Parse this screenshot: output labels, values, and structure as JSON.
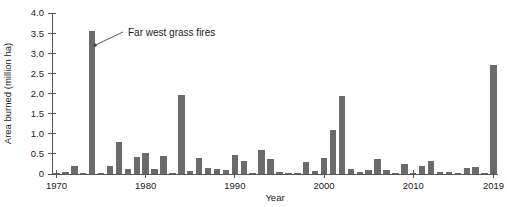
{
  "chart_data": {
    "type": "bar",
    "title": "",
    "subtitle": "",
    "xlabel": "Year",
    "ylabel": "Area burned (million ha)",
    "xlim": [
      1969.5,
      2019.5
    ],
    "ylim": [
      0,
      4.0
    ],
    "grid": false,
    "legend": false,
    "legend_position": "none",
    "bar_color": "#6b6b6b",
    "axis_color": "#555555",
    "y_ticks": [
      0,
      0.5,
      1.0,
      1.5,
      2.0,
      2.5,
      3.0,
      3.5,
      4.0
    ],
    "y_tick_labels": [
      "0",
      "0.5",
      "1.0",
      "1.5",
      "2.0",
      "2.5",
      "3.0",
      "3.5",
      "4.0"
    ],
    "x_ticks": [
      1970,
      1980,
      1990,
      2000,
      2010,
      2019
    ],
    "x_tick_labels": [
      "1970",
      "1980",
      "1990",
      "2000",
      "2010",
      "2019"
    ],
    "categories": [
      1970,
      1971,
      1972,
      1973,
      1974,
      1975,
      1976,
      1977,
      1978,
      1979,
      1980,
      1981,
      1982,
      1983,
      1984,
      1985,
      1986,
      1987,
      1988,
      1989,
      1990,
      1991,
      1992,
      1993,
      1994,
      1995,
      1996,
      1997,
      1998,
      1999,
      2000,
      2001,
      2002,
      2003,
      2004,
      2005,
      2006,
      2007,
      2008,
      2009,
      2010,
      2011,
      2012,
      2013,
      2014,
      2015,
      2016,
      2017,
      2018,
      2019
    ],
    "values": [
      0.02,
      0.04,
      0.2,
      0.03,
      3.55,
      0.02,
      0.21,
      0.8,
      0.12,
      0.43,
      0.51,
      0.13,
      0.45,
      0.03,
      1.96,
      0.08,
      0.39,
      0.15,
      0.12,
      0.11,
      0.48,
      0.33,
      0.03,
      0.6,
      0.38,
      0.06,
      0.03,
      0.02,
      0.3,
      0.07,
      0.4,
      1.1,
      1.95,
      0.12,
      0.06,
      0.1,
      0.38,
      0.11,
      0.03,
      0.26,
      0.02,
      0.2,
      0.32,
      0.05,
      0.04,
      0.02,
      0.16,
      0.18,
      0.03,
      2.7
    ],
    "annotations": [
      {
        "text": "Far west grass fires",
        "points_to_year": 1974,
        "points_to_value": 3.2
      }
    ]
  },
  "annotation": {
    "label": "Far west grass fires"
  }
}
